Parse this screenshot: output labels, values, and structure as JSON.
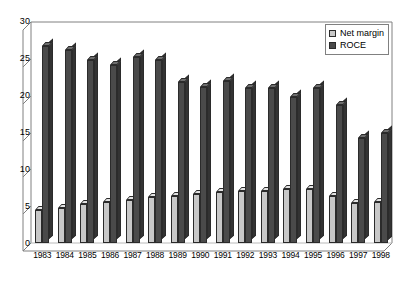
{
  "chart_data": {
    "type": "bar",
    "title": "",
    "subtitle": "",
    "xlabel": "",
    "ylabel": "",
    "ylim": [
      0,
      30
    ],
    "ytick_step": 5,
    "yticks": [
      0,
      5,
      10,
      15,
      20,
      25,
      30
    ],
    "grid": false,
    "legend_position": "top-right",
    "style": "3d-clustered-column",
    "categories": [
      "1983",
      "1984",
      "1985",
      "1986",
      "1987",
      "1988",
      "1989",
      "1990",
      "1991",
      "1992",
      "1993",
      "1994",
      "1995",
      "1996",
      "1997",
      "1998"
    ],
    "series": [
      {
        "name": "Net margin",
        "color": "#c8c8c8",
        "values": [
          4.5,
          4.8,
          5.3,
          5.6,
          5.9,
          6.2,
          6.4,
          6.7,
          6.9,
          7.0,
          7.1,
          7.3,
          7.4,
          6.4,
          5.4,
          5.5
        ]
      },
      {
        "name": "ROCE",
        "color": "#4a4a4a",
        "values": [
          26.7,
          26.2,
          24.8,
          24.1,
          25.3,
          24.9,
          21.8,
          21.2,
          22.0,
          21.0,
          21.0,
          19.8,
          21.1,
          18.8,
          14.3,
          15.0
        ]
      }
    ]
  },
  "legend": {
    "items": [
      {
        "label": "Net margin",
        "swatch": "legend-swatch-net-margin"
      },
      {
        "label": "ROCE",
        "swatch": "legend-swatch-roce"
      }
    ]
  },
  "axis": {
    "y_tick_labels": [
      "30",
      "25",
      "20",
      "15",
      "10",
      "5",
      "0"
    ],
    "x_tick_labels": [
      "1983",
      "1984",
      "1985",
      "1986",
      "1987",
      "1988",
      "1989",
      "1990",
      "1991",
      "1992",
      "1993",
      "1994",
      "1995",
      "1996",
      "1997",
      "1998"
    ]
  }
}
